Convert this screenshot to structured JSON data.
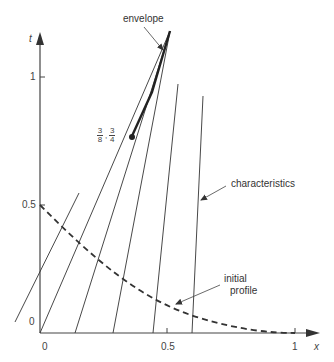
{
  "diagram": {
    "type": "characteristics-diagram",
    "axes": {
      "x_label": "x",
      "t_label": "t",
      "x_ticks": [
        "0",
        "0.5",
        "1"
      ],
      "t_ticks": [
        "0",
        "0.5",
        "1"
      ]
    },
    "annotations": {
      "envelope": "envelope",
      "characteristics": "characteristics",
      "initial_profile_line1": "initial",
      "initial_profile_line2": "profile",
      "point": {
        "x_num": "3",
        "x_den": "8",
        "sep": ",",
        "t_num": "3",
        "t_den": "4"
      }
    },
    "colors": {
      "line": "#333333",
      "text": "#444444"
    }
  }
}
